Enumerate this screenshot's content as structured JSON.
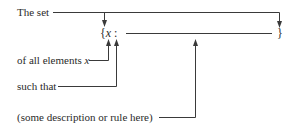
{
  "diagram": {
    "labels": {
      "the_set": "The set",
      "of_all_elements": "of all elements x",
      "such_that": "such that",
      "description": "(some description or rule here)"
    },
    "notation": {
      "open_brace": "{",
      "variable": "x",
      "colon": ":",
      "close_brace": "}"
    }
  }
}
